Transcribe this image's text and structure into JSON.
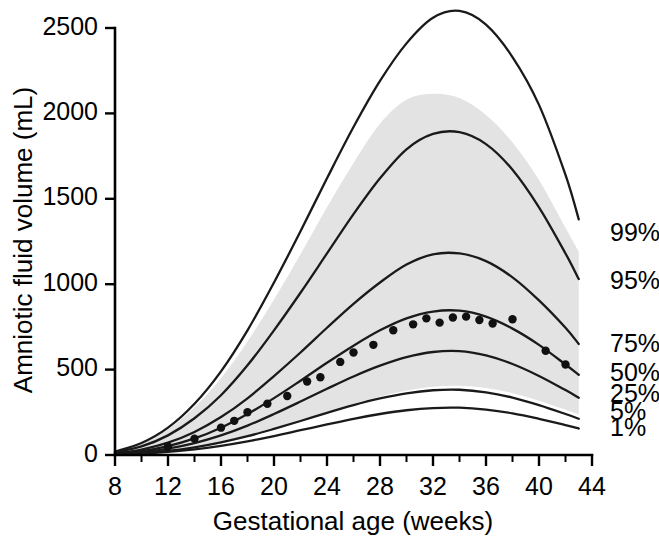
{
  "chart_data": {
    "type": "line",
    "title": "",
    "xlabel": "Gestational age (weeks)",
    "ylabel": "Amniotic fluid volume (mL)",
    "xlim": [
      8,
      44
    ],
    "ylim": [
      0,
      2500
    ],
    "xticks": [
      8,
      12,
      16,
      20,
      24,
      28,
      32,
      36,
      40,
      44
    ],
    "xtick_labels": [
      "8",
      "12",
      "16",
      "20",
      "24",
      "28",
      "32",
      "36",
      "40",
      "44"
    ],
    "xminor_ticks": [
      10,
      14,
      18,
      22,
      26,
      30,
      34,
      38,
      42
    ],
    "yticks": [
      0,
      500,
      1000,
      1500,
      2000,
      2500
    ],
    "ytick_labels": [
      "0",
      "500",
      "1000",
      "1500",
      "2000",
      "2500"
    ],
    "grid": false,
    "legend_position": "right-of-curve-ends",
    "x": [
      8,
      10,
      12,
      14,
      16,
      18,
      20,
      22,
      24,
      26,
      28,
      30,
      32,
      34,
      36,
      38,
      40,
      42,
      43
    ],
    "series": [
      {
        "name": "99%",
        "label": "99%",
        "color": "#1a1a1a",
        "values": [
          20,
          70,
          160,
          300,
          490,
          730,
          1010,
          1310,
          1620,
          1920,
          2190,
          2410,
          2560,
          2600,
          2520,
          2330,
          2050,
          1640,
          1380
        ]
      },
      {
        "name": "95%",
        "label": "95%",
        "color": "#1a1a1a",
        "values": [
          15,
          50,
          115,
          215,
          350,
          525,
          730,
          950,
          1180,
          1410,
          1620,
          1790,
          1880,
          1890,
          1820,
          1670,
          1450,
          1180,
          1030
        ]
      },
      {
        "name": "75%",
        "label": "75%",
        "color": "#1a1a1a",
        "values": [
          10,
          32,
          72,
          135,
          222,
          332,
          462,
          600,
          745,
          885,
          1010,
          1115,
          1175,
          1180,
          1135,
          1040,
          905,
          745,
          650
        ]
      },
      {
        "name": "50%",
        "label": "50%",
        "color": "#1a1a1a",
        "values": [
          8,
          23,
          52,
          97,
          160,
          240,
          333,
          435,
          540,
          640,
          730,
          800,
          840,
          845,
          810,
          740,
          645,
          530,
          470
        ]
      },
      {
        "name": "25%",
        "label": "25%",
        "color": "#1a1a1a",
        "values": [
          6,
          17,
          38,
          70,
          115,
          172,
          240,
          313,
          388,
          460,
          523,
          573,
          603,
          608,
          583,
          533,
          463,
          380,
          335
        ]
      },
      {
        "name": "5%",
        "label": "5%",
        "color": "#1a1a1a",
        "values": [
          4,
          11,
          24,
          45,
          74,
          110,
          153,
          199,
          247,
          292,
          331,
          361,
          379,
          382,
          367,
          336,
          292,
          240,
          212
        ]
      },
      {
        "name": "1%",
        "label": "1%",
        "color": "#1a1a1a",
        "values": [
          3,
          8,
          18,
          33,
          54,
          80,
          111,
          145,
          179,
          212,
          240,
          262,
          275,
          277,
          266,
          244,
          212,
          175,
          155
        ]
      }
    ],
    "reference_band": {
      "name": "shaded reference range",
      "color": "#e3e3e3",
      "x": [
        8,
        10,
        12,
        14,
        16,
        18,
        20,
        22,
        24,
        26,
        28,
        30,
        32,
        34,
        36,
        38,
        40,
        42,
        43
      ],
      "upper": [
        22,
        68,
        150,
        280,
        450,
        665,
        910,
        1175,
        1450,
        1710,
        1940,
        2080,
        2115,
        2090,
        1990,
        1830,
        1610,
        1330,
        1190
      ],
      "lower": [
        2,
        8,
        20,
        40,
        68,
        104,
        148,
        196,
        248,
        298,
        342,
        377,
        400,
        405,
        392,
        362,
        318,
        265,
        237
      ]
    },
    "scatter": {
      "name": "observed data points",
      "color": "#111111",
      "points": [
        {
          "x": 12.0,
          "y": 50
        },
        {
          "x": 14.0,
          "y": 95
        },
        {
          "x": 16.0,
          "y": 160
        },
        {
          "x": 17.0,
          "y": 200
        },
        {
          "x": 18.0,
          "y": 250
        },
        {
          "x": 19.5,
          "y": 300
        },
        {
          "x": 21.0,
          "y": 345
        },
        {
          "x": 22.5,
          "y": 430
        },
        {
          "x": 23.5,
          "y": 455
        },
        {
          "x": 25.0,
          "y": 545
        },
        {
          "x": 26.0,
          "y": 600
        },
        {
          "x": 27.5,
          "y": 645
        },
        {
          "x": 29.0,
          "y": 730
        },
        {
          "x": 30.5,
          "y": 765
        },
        {
          "x": 31.5,
          "y": 800
        },
        {
          "x": 32.5,
          "y": 775
        },
        {
          "x": 33.5,
          "y": 805
        },
        {
          "x": 34.5,
          "y": 810
        },
        {
          "x": 35.5,
          "y": 790
        },
        {
          "x": 36.5,
          "y": 770
        },
        {
          "x": 38.0,
          "y": 795
        },
        {
          "x": 40.5,
          "y": 610
        },
        {
          "x": 42.0,
          "y": 530
        }
      ]
    }
  },
  "percentile_labels": [
    {
      "text": "99%",
      "y_value": 1290
    },
    {
      "text": "95%",
      "y_value": 1010
    },
    {
      "text": "75%",
      "y_value": 640
    },
    {
      "text": "50%",
      "y_value": 472
    },
    {
      "text": "25%",
      "y_value": 350
    },
    {
      "text": "5%",
      "y_value": 245
    },
    {
      "text": "1%",
      "y_value": 150
    }
  ]
}
